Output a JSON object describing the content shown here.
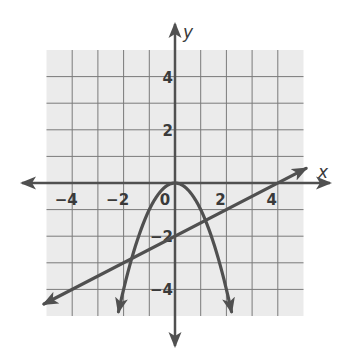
{
  "chart_data": {
    "type": "line",
    "title": "",
    "xlabel": "x",
    "ylabel": "y",
    "xlim": [
      -5,
      5
    ],
    "ylim": [
      -5,
      5
    ],
    "grid": true,
    "grid_step": 1,
    "x_tick_labels": [
      {
        "value": -4,
        "label": "−4"
      },
      {
        "value": -2,
        "label": "−2"
      },
      {
        "value": 0,
        "label": "0"
      },
      {
        "value": 2,
        "label": "2"
      },
      {
        "value": 4,
        "label": "4"
      }
    ],
    "y_tick_labels": [
      {
        "value": 4,
        "label": "4"
      },
      {
        "value": 2,
        "label": "2"
      },
      {
        "value": -2,
        "label": "−2"
      },
      {
        "value": -4,
        "label": "−4"
      }
    ],
    "series": [
      {
        "name": "parabola",
        "equation": "y = -x^2",
        "kind": "parabola",
        "x_range": [
          -2.2,
          2.2
        ],
        "arrows": "both-ends",
        "points": [
          [
            -2.2,
            -4.84
          ],
          [
            -2,
            -4
          ],
          [
            -1.5,
            -2.25
          ],
          [
            -1,
            -1
          ],
          [
            -0.5,
            -0.25
          ],
          [
            0,
            0
          ],
          [
            0.5,
            -0.25
          ],
          [
            1,
            -1
          ],
          [
            1.5,
            -2.25
          ],
          [
            2,
            -4
          ],
          [
            2.2,
            -4.84
          ]
        ]
      },
      {
        "name": "line",
        "equation": "y = 0.5x - 2",
        "kind": "line",
        "x_range": [
          -5.1,
          5.1
        ],
        "arrows": "both-ends",
        "points": [
          [
            -5.1,
            -4.55
          ],
          [
            0,
            -2
          ],
          [
            4,
            0
          ],
          [
            5.1,
            0.55
          ]
        ]
      }
    ],
    "intersections": [
      [
        -1.69,
        -2.84
      ],
      [
        1.19,
        -1.41
      ]
    ],
    "colors": {
      "grid_background": "#ebebeb",
      "grid_lines": "#7a7a7a",
      "curves": "#505050",
      "axes": "#505050"
    }
  }
}
